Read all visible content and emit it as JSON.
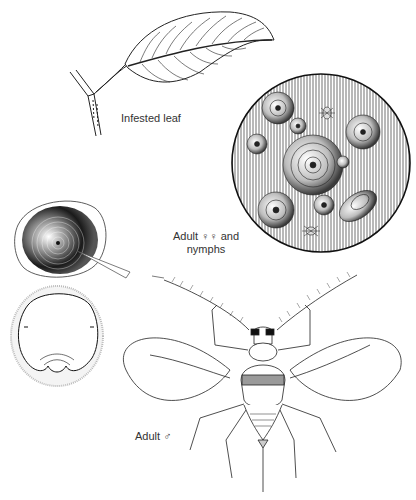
{
  "figure": {
    "type": "scientific-illustration",
    "style": "black-and-white pen line drawing",
    "background": "#ffffff",
    "ink": "#1a1a1a"
  },
  "labels": {
    "infested_leaf": "Infested leaf",
    "adult_female_line1": "Adult ♀♀ and",
    "adult_female_line2": "nymphs",
    "adult_male": "Adult ♂"
  },
  "panels": [
    {
      "id": "leaf",
      "depicts": "leaf on twig with infestation along midrib"
    },
    {
      "id": "magnified-circle",
      "depicts": "magnified leaf surface with round scale covers and two nymphs"
    },
    {
      "id": "scale-cover",
      "depicts": "single scale cover with concentric rings and pointer line"
    },
    {
      "id": "scale-underside",
      "depicts": "female body beneath scale"
    },
    {
      "id": "adult-male",
      "depicts": "winged adult male with long antennae"
    }
  ]
}
